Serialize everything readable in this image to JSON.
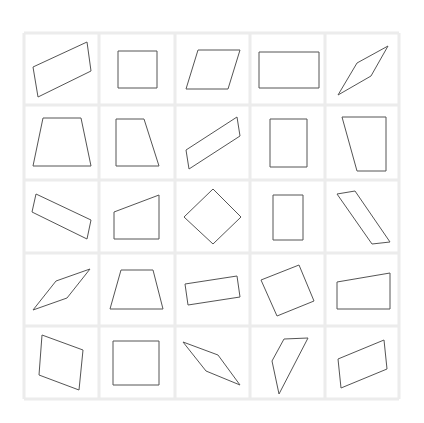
{
  "grid": {
    "rows": 5,
    "cols": 5,
    "x_lines": [
      24,
      99,
      175,
      250,
      325,
      399
    ],
    "y_lines": [
      33,
      105,
      180,
      253,
      326,
      399
    ],
    "line_color": "#ececec",
    "stroke_color": "#555555"
  },
  "cells": [
    {
      "row": 1,
      "col": 1,
      "shape": "parallelogram",
      "points": [
        [
          33,
          67
        ],
        [
          87,
          42
        ],
        [
          91,
          71
        ],
        [
          38,
          97
        ]
      ]
    },
    {
      "row": 1,
      "col": 2,
      "shape": "square",
      "points": [
        [
          118,
          51
        ],
        [
          157,
          51
        ],
        [
          157,
          88
        ],
        [
          118,
          88
        ]
      ]
    },
    {
      "row": 1,
      "col": 3,
      "shape": "parallelogram",
      "points": [
        [
          198,
          50
        ],
        [
          240,
          50
        ],
        [
          228,
          89
        ],
        [
          186,
          89
        ]
      ]
    },
    {
      "row": 1,
      "col": 4,
      "shape": "rectangle",
      "points": [
        [
          259,
          52
        ],
        [
          319,
          52
        ],
        [
          319,
          88
        ],
        [
          259,
          88
        ]
      ]
    },
    {
      "row": 1,
      "col": 5,
      "shape": "rhombus",
      "points": [
        [
          338,
          95
        ],
        [
          357,
          63
        ],
        [
          388,
          46
        ],
        [
          371,
          76
        ]
      ]
    },
    {
      "row": 2,
      "col": 1,
      "shape": "trapezoid",
      "points": [
        [
          43,
          118
        ],
        [
          81,
          118
        ],
        [
          91,
          166
        ],
        [
          33,
          166
        ]
      ]
    },
    {
      "row": 2,
      "col": 2,
      "shape": "right-trapezoid",
      "points": [
        [
          116,
          119
        ],
        [
          144,
          119
        ],
        [
          159,
          166
        ],
        [
          116,
          166
        ]
      ]
    },
    {
      "row": 2,
      "col": 3,
      "shape": "parallelogram",
      "points": [
        [
          186,
          150
        ],
        [
          237,
          117
        ],
        [
          240,
          136
        ],
        [
          189,
          169
        ]
      ]
    },
    {
      "row": 2,
      "col": 4,
      "shape": "rectangle",
      "points": [
        [
          270,
          119
        ],
        [
          307,
          119
        ],
        [
          307,
          167
        ],
        [
          270,
          167
        ]
      ]
    },
    {
      "row": 2,
      "col": 5,
      "shape": "right-trapezoid",
      "points": [
        [
          342,
          117
        ],
        [
          386,
          117
        ],
        [
          386,
          171
        ],
        [
          357,
          171
        ]
      ]
    },
    {
      "row": 3,
      "col": 1,
      "shape": "rectangle",
      "points": [
        [
          36,
          194
        ],
        [
          91,
          220
        ],
        [
          87,
          239
        ],
        [
          32,
          212
        ]
      ]
    },
    {
      "row": 3,
      "col": 2,
      "shape": "right-trapezoid",
      "points": [
        [
          114,
          212
        ],
        [
          159,
          195
        ],
        [
          159,
          239
        ],
        [
          114,
          239
        ]
      ]
    },
    {
      "row": 3,
      "col": 3,
      "shape": "square",
      "points": [
        [
          213,
          189
        ],
        [
          241,
          217
        ],
        [
          213,
          244
        ],
        [
          184,
          217
        ]
      ]
    },
    {
      "row": 3,
      "col": 4,
      "shape": "rectangle",
      "points": [
        [
          273,
          195
        ],
        [
          303,
          195
        ],
        [
          303,
          240
        ],
        [
          273,
          240
        ]
      ]
    },
    {
      "row": 3,
      "col": 5,
      "shape": "parallelogram",
      "points": [
        [
          337,
          194
        ],
        [
          355,
          191
        ],
        [
          390,
          242
        ],
        [
          372,
          244
        ]
      ]
    },
    {
      "row": 4,
      "col": 1,
      "shape": "rhombus",
      "points": [
        [
          33,
          310
        ],
        [
          56,
          281
        ],
        [
          90,
          269
        ],
        [
          67,
          298
        ]
      ]
    },
    {
      "row": 4,
      "col": 2,
      "shape": "trapezoid",
      "points": [
        [
          121,
          270
        ],
        [
          153,
          270
        ],
        [
          163,
          309
        ],
        [
          110,
          309
        ]
      ]
    },
    {
      "row": 4,
      "col": 3,
      "shape": "rectangle",
      "points": [
        [
          185,
          284
        ],
        [
          237,
          276
        ],
        [
          240,
          297
        ],
        [
          188,
          305
        ]
      ]
    },
    {
      "row": 4,
      "col": 4,
      "shape": "square",
      "points": [
        [
          261,
          280
        ],
        [
          299,
          265
        ],
        [
          314,
          301
        ],
        [
          277,
          316
        ]
      ]
    },
    {
      "row": 4,
      "col": 5,
      "shape": "right-trapezoid",
      "points": [
        [
          337,
          282
        ],
        [
          390,
          273
        ],
        [
          390,
          309
        ],
        [
          337,
          309
        ]
      ]
    },
    {
      "row": 5,
      "col": 1,
      "shape": "parallelogram",
      "points": [
        [
          42,
          335
        ],
        [
          83,
          350
        ],
        [
          79,
          390
        ],
        [
          39,
          375
        ]
      ]
    },
    {
      "row": 5,
      "col": 2,
      "shape": "square",
      "points": [
        [
          113,
          341
        ],
        [
          159,
          341
        ],
        [
          159,
          385
        ],
        [
          113,
          385
        ]
      ]
    },
    {
      "row": 5,
      "col": 3,
      "shape": "kite",
      "points": [
        [
          183,
          342
        ],
        [
          218,
          355
        ],
        [
          240,
          385
        ],
        [
          206,
          371
        ]
      ]
    },
    {
      "row": 5,
      "col": 4,
      "shape": "quadrilateral",
      "points": [
        [
          284,
          339
        ],
        [
          308,
          338
        ],
        [
          279,
          394
        ],
        [
          272,
          361
        ]
      ]
    },
    {
      "row": 5,
      "col": 5,
      "shape": "parallelogram",
      "points": [
        [
          338,
          359
        ],
        [
          384,
          340
        ],
        [
          387,
          369
        ],
        [
          341,
          388
        ]
      ]
    }
  ]
}
